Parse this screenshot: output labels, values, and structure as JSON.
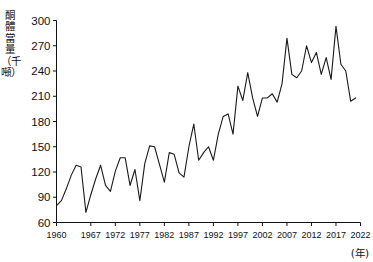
{
  "chart_data": {
    "type": "line",
    "title": "",
    "xlabel": "(年)",
    "ylabel": "酮體當量（千噸）",
    "xlim": [
      1960,
      2022
    ],
    "ylim": [
      60,
      300
    ],
    "yticks": [
      60,
      90,
      120,
      150,
      180,
      210,
      240,
      270,
      300
    ],
    "xticks": [
      1960,
      1967,
      1972,
      1977,
      1982,
      1987,
      1992,
      1997,
      2002,
      2007,
      2012,
      2017,
      2022
    ],
    "grid": false,
    "legend": null,
    "series": [
      {
        "name": "酮體當量",
        "x": [
          1960,
          1961,
          1962,
          1963,
          1964,
          1965,
          1966,
          1967,
          1968,
          1969,
          1970,
          1971,
          1972,
          1973,
          1974,
          1975,
          1976,
          1977,
          1978,
          1979,
          1980,
          1981,
          1982,
          1983,
          1984,
          1985,
          1986,
          1987,
          1988,
          1989,
          1990,
          1991,
          1992,
          1993,
          1994,
          1995,
          1996,
          1997,
          1998,
          1999,
          2000,
          2001,
          2002,
          2003,
          2004,
          2005,
          2006,
          2007,
          2008,
          2009,
          2010,
          2011,
          2012,
          2013,
          2014,
          2015,
          2016,
          2017,
          2018,
          2019,
          2020,
          2021
        ],
        "values": [
          80,
          86,
          100,
          116,
          128,
          126,
          72,
          93,
          112,
          128,
          104,
          97,
          121,
          137,
          137,
          104,
          123,
          86,
          130,
          151,
          150,
          129,
          108,
          143,
          141,
          119,
          114,
          150,
          177,
          134,
          143,
          150,
          134,
          165,
          186,
          189,
          165,
          222,
          205,
          238,
          208,
          186,
          208,
          208,
          213,
          203,
          225,
          279,
          236,
          232,
          240,
          270,
          250,
          262,
          236,
          256,
          230,
          293,
          248,
          240,
          204,
          208
        ]
      }
    ]
  }
}
